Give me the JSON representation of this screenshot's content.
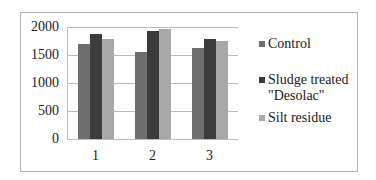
{
  "chart_data": {
    "type": "bar",
    "title": "",
    "xlabel": "",
    "ylabel": "",
    "categories": [
      "1",
      "2",
      "3"
    ],
    "series": [
      {
        "name": "Control",
        "color": "#6e6e6e",
        "values": [
          1690,
          1555,
          1625
        ]
      },
      {
        "name": "Sludge treated \"Desolac\"",
        "color": "#3c3c3c",
        "values": [
          1870,
          1930,
          1780
        ]
      },
      {
        "name": "Silt residue",
        "color": "#a8a8a8",
        "values": [
          1785,
          1965,
          1755
        ]
      }
    ],
    "ylim": [
      0,
      2000
    ],
    "yticks": [
      "0",
      "500",
      "1000",
      "1500",
      "2000"
    ],
    "grid": true,
    "legend_position": "right"
  },
  "legend": {
    "items": [
      {
        "label_line1": "Control",
        "label_line2": ""
      },
      {
        "label_line1": "Sludge treated",
        "label_line2": "\"Desolac\""
      },
      {
        "label_line1": "Silt residue",
        "label_line2": ""
      }
    ]
  }
}
